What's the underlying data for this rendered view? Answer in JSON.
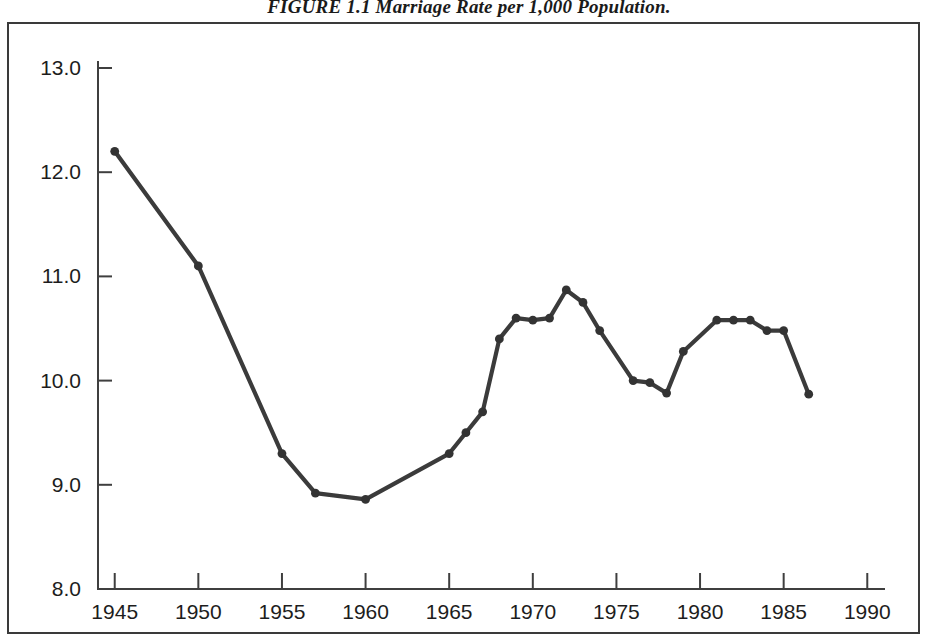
{
  "figure": {
    "caption_label": "FIGURE 1.1",
    "caption_text": "Marriage Rate per 1,000 Population.",
    "frame_color": "#3a3a3a",
    "line_color": "#3b3b3b",
    "marker_color": "#333333",
    "background_color": "#ffffff"
  },
  "chart_data": {
    "type": "line",
    "title": "FIGURE 1.1 Marriage Rate per 1,000 Population.",
    "xlabel": "",
    "ylabel": "",
    "xlim": [
      1944,
      1991
    ],
    "ylim": [
      8.0,
      13.0
    ],
    "grid": false,
    "legend": "none",
    "yticks": [
      "13.0",
      "12.0",
      "11.0",
      "10.0",
      "9.0",
      "8.0"
    ],
    "ytick_values": [
      13.0,
      12.0,
      11.0,
      10.0,
      9.0,
      8.0
    ],
    "xticks": [
      "1945",
      "1950",
      "1955",
      "1960",
      "1965",
      "1970",
      "1975",
      "1980",
      "1985",
      "1990"
    ],
    "xtick_values": [
      1945,
      1950,
      1955,
      1960,
      1965,
      1970,
      1975,
      1980,
      1985,
      1990
    ],
    "series": [
      {
        "name": "Marriage rate per 1,000 population",
        "x": [
          1945,
          1950,
          1955,
          1957,
          1960,
          1965,
          1966,
          1967,
          1968,
          1969,
          1970,
          1971,
          1972,
          1973,
          1974,
          1976,
          1977,
          1978,
          1979,
          1981,
          1982,
          1983,
          1984,
          1985,
          1986.5
        ],
        "values": [
          12.2,
          11.1,
          9.3,
          8.92,
          8.86,
          9.3,
          9.5,
          9.7,
          10.4,
          10.6,
          10.58,
          10.6,
          10.87,
          10.75,
          10.48,
          10.0,
          9.98,
          9.88,
          10.28,
          10.58,
          10.58,
          10.58,
          10.48,
          10.48,
          9.87
        ]
      }
    ]
  }
}
